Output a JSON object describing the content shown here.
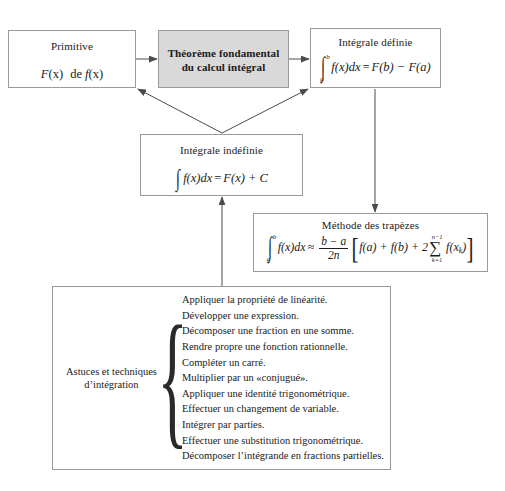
{
  "diagram": {
    "colors": {
      "box_border": "#9a9a9a",
      "box_fill": "#ffffff",
      "highlight_fill": "#d9d9d9",
      "arrow": "#4a4a4a",
      "text": "#1a1a1a"
    }
  },
  "nodes": {
    "primitive": {
      "title": "Primitive",
      "formula_text": "F(x) de f(x)",
      "formula": {
        "F": "F",
        "x1": "(x)",
        "de": "de",
        "f": "f",
        "x2": "(x)"
      }
    },
    "theoreme": {
      "title_line1": "Théorème fondamental",
      "title_line2": "du calcul intégral",
      "highlighted": true
    },
    "integrale_definie": {
      "title": "Intégrale définie",
      "formula_text": "∫ab f(x)dx = F(b) − F(a)",
      "formula": {
        "upper_limit": "b",
        "lower_limit": "a",
        "integrand": "f(x)dx",
        "equals": "=",
        "rhs": "F(b) − F(a)"
      }
    },
    "integrale_indefinie": {
      "title": "Intégrale indéfinie",
      "formula_text": "∫ f(x)dx = F(x) + C",
      "formula": {
        "integrand": "f(x)dx",
        "equals": "=",
        "rhs": "F(x) + C"
      }
    },
    "trapezes": {
      "title": "Méthode des trapèzes",
      "formula_text": "∫ab f(x)dx ≈ (b − a)/(2n) [ f(a) + f(b) + 2 Σk=1..n−1 f(xk) ]",
      "formula": {
        "upper_limit": "b",
        "lower_limit": "a",
        "integrand": "f(x)dx",
        "approx": "≈",
        "frac_num": "b − a",
        "frac_den": "2n",
        "bracket_open": "[",
        "terms": "f(a) + f(b) + 2",
        "sum_top": "n−1",
        "sum_sym": "∑",
        "sum_bot": "k=1",
        "sum_arg": "f(x",
        "sum_arg_sub": "k",
        "sum_arg_close": ")",
        "bracket_close": "]"
      }
    },
    "astuces": {
      "label_line1": "Astuces et techniques",
      "label_line2": "d’intégration",
      "brace": "{",
      "items": [
        "Appliquer la propriété de linéarité.",
        "Développer une expression.",
        "Décomposer une fraction en une somme.",
        "Rendre propre une fonction rationnelle.",
        "Compléter un carré.",
        "Multiplier par un «conjugué».",
        "Appliquer une identité trigonométrique.",
        "Effectuer un changement de variable.",
        "Intégrer par parties.",
        "Effectuer une substitution trigonométrique.",
        "Décomposer l’intégrande en fractions partielles."
      ]
    }
  },
  "edges": [
    {
      "name": "primitive-to-theoreme",
      "from": "primitive",
      "to": "theoreme"
    },
    {
      "name": "theoreme-to-integrale-definie",
      "from": "theoreme",
      "to": "integrale_definie"
    },
    {
      "name": "indefinie-to-primitive",
      "from": "integrale_indefinie",
      "to": "primitive"
    },
    {
      "name": "indefinie-to-definie",
      "from": "integrale_indefinie",
      "to": "integrale_definie"
    },
    {
      "name": "definie-to-trapezes",
      "from": "integrale_definie",
      "to": "trapezes"
    },
    {
      "name": "astuces-to-indefinie",
      "from": "astuces",
      "to": "integrale_indefinie"
    }
  ]
}
